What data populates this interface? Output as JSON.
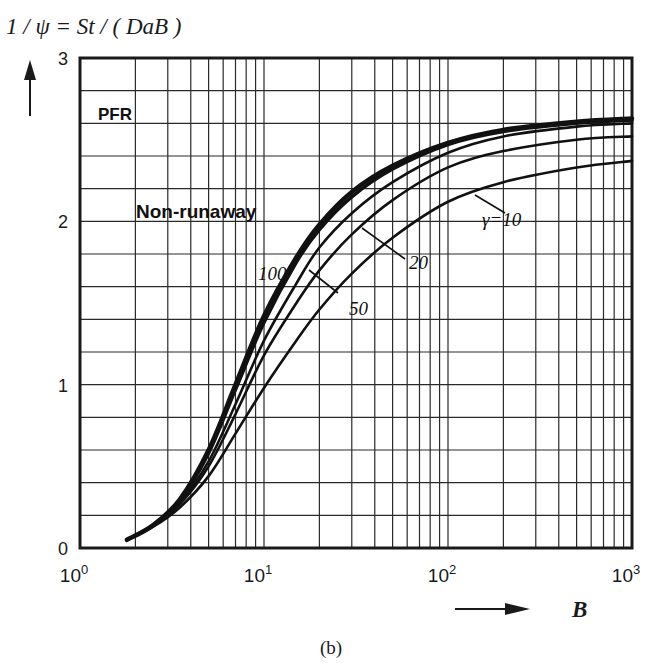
{
  "chart_data": {
    "type": "line",
    "title": "",
    "ylabel": "1 / ψ = St / ( DaB )",
    "xlabel": "B",
    "caption": "(b)",
    "xscale": "log",
    "xlim": [
      1,
      1000
    ],
    "ylim": [
      0,
      3
    ],
    "grid": true,
    "x_tick_labels": [
      {
        "base": "10",
        "exp": "0",
        "value": 1
      },
      {
        "base": "10",
        "exp": "1",
        "value": 10
      },
      {
        "base": "10",
        "exp": "2",
        "value": 100
      },
      {
        "base": "10",
        "exp": "3",
        "value": 1000
      }
    ],
    "y_tick_labels": [
      "0",
      "1",
      "2",
      "3"
    ],
    "y_minor_step": 0.2,
    "annotations": [
      {
        "text": "PFR",
        "x": 1.4,
        "y": 2.7
      },
      {
        "text": "Non-runaway",
        "x": 1.5,
        "y": 2.05
      },
      {
        "text": "100",
        "x": 6.5,
        "y": 1.65
      },
      {
        "text": "50",
        "x": 15,
        "y": 1.42
      },
      {
        "text": "20",
        "x": 38,
        "y": 1.75
      },
      {
        "text": "γ=10",
        "x": 150,
        "y": 2.0
      }
    ],
    "series": [
      {
        "name": "PFR",
        "x": [
          1.8,
          2.5,
          3.5,
          5,
          7,
          10,
          15,
          20,
          30,
          50,
          100,
          200,
          500,
          1000
        ],
        "values": [
          0.05,
          0.14,
          0.3,
          0.6,
          1.0,
          1.42,
          1.78,
          1.98,
          2.18,
          2.34,
          2.48,
          2.56,
          2.61,
          2.63
        ]
      },
      {
        "name": "γ=100",
        "x": [
          1.8,
          2.5,
          3.5,
          5,
          7,
          10,
          15,
          20,
          30,
          50,
          100,
          200,
          500,
          1000
        ],
        "values": [
          0.05,
          0.14,
          0.29,
          0.58,
          0.97,
          1.38,
          1.75,
          1.95,
          2.15,
          2.32,
          2.47,
          2.55,
          2.6,
          2.62
        ]
      },
      {
        "name": "γ=50",
        "x": [
          1.8,
          2.5,
          3.5,
          5,
          7,
          10,
          15,
          20,
          30,
          50,
          100,
          200,
          500,
          1000
        ],
        "values": [
          0.05,
          0.14,
          0.28,
          0.53,
          0.88,
          1.27,
          1.62,
          1.84,
          2.05,
          2.24,
          2.42,
          2.52,
          2.58,
          2.6
        ]
      },
      {
        "name": "γ=20",
        "x": [
          1.8,
          2.5,
          3.5,
          5,
          7,
          10,
          15,
          20,
          30,
          50,
          100,
          200,
          500,
          1000
        ],
        "values": [
          0.05,
          0.14,
          0.27,
          0.5,
          0.82,
          1.18,
          1.5,
          1.7,
          1.92,
          2.13,
          2.33,
          2.43,
          2.5,
          2.52
        ]
      },
      {
        "name": "γ=10",
        "x": [
          1.8,
          2.5,
          3.5,
          5,
          7,
          10,
          15,
          20,
          30,
          50,
          100,
          200,
          500,
          1000
        ],
        "values": [
          0.05,
          0.13,
          0.25,
          0.44,
          0.7,
          0.98,
          1.27,
          1.46,
          1.68,
          1.9,
          2.12,
          2.24,
          2.33,
          2.37
        ]
      }
    ]
  }
}
